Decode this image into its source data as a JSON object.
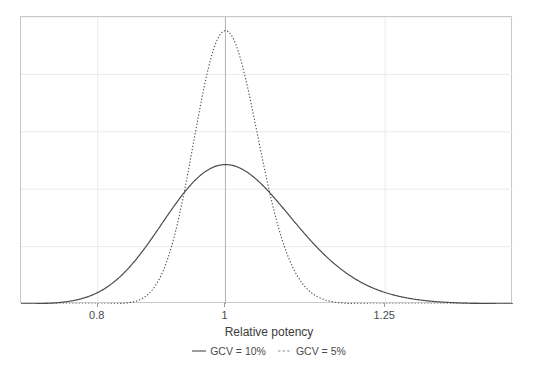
{
  "chart_data": {
    "type": "line",
    "title": "",
    "xlabel": "Relative potency",
    "ylabel": "",
    "xlim": [
      0.68,
      1.45
    ],
    "ylim": [
      0,
      1.05
    ],
    "xticks": [
      0.8,
      1,
      1.25
    ],
    "xticklabels": [
      "0.8",
      "1",
      "1.25"
    ],
    "grid": true,
    "grid_color": "#ebebeb",
    "legend_position": "bottom",
    "reference_line_x": 1,
    "series": [
      {
        "name": "GCV = 10%",
        "style": "solid",
        "color": "#4d4d4d",
        "peak_x": 1,
        "peak_y": 0.51,
        "sigma_log": 0.0998,
        "x": [
          0.68,
          0.7,
          0.72,
          0.74,
          0.76,
          0.78,
          0.8,
          0.82,
          0.84,
          0.86,
          0.88,
          0.9,
          0.92,
          0.94,
          0.96,
          0.98,
          1.0,
          1.02,
          1.04,
          1.06,
          1.08,
          1.1,
          1.13,
          1.16,
          1.19,
          1.22,
          1.25,
          1.28,
          1.32,
          1.36,
          1.4,
          1.45
        ],
        "y": [
          0.033,
          0.048,
          0.068,
          0.093,
          0.123,
          0.158,
          0.197,
          0.239,
          0.281,
          0.323,
          0.362,
          0.398,
          0.429,
          0.454,
          0.473,
          0.485,
          0.49,
          0.488,
          0.481,
          0.468,
          0.451,
          0.43,
          0.393,
          0.352,
          0.31,
          0.268,
          0.229,
          0.194,
          0.153,
          0.119,
          0.092,
          0.064
        ]
      },
      {
        "name": "GCV = 5%",
        "style": "dotted",
        "color": "#4d4d4d",
        "peak_x": 1,
        "peak_y": 1.0,
        "sigma_log": 0.04996,
        "x": [
          0.68,
          0.72,
          0.76,
          0.8,
          0.82,
          0.84,
          0.86,
          0.88,
          0.9,
          0.92,
          0.94,
          0.96,
          0.98,
          1.0,
          1.02,
          1.04,
          1.06,
          1.08,
          1.1,
          1.12,
          1.14,
          1.16,
          1.18,
          1.2,
          1.25,
          1.3,
          1.35,
          1.45
        ],
        "y": [
          0.0,
          0.0,
          0.002,
          0.016,
          0.036,
          0.071,
          0.127,
          0.208,
          0.313,
          0.437,
          0.567,
          0.692,
          0.796,
          0.868,
          0.902,
          0.9,
          0.865,
          0.806,
          0.73,
          0.646,
          0.559,
          0.475,
          0.397,
          0.327,
          0.191,
          0.103,
          0.052,
          0.011
        ]
      }
    ]
  },
  "axis": {
    "x_title": "Relative potency",
    "ticks": [
      {
        "label": "0.8",
        "value": 0.8
      },
      {
        "label": "1",
        "value": 1
      },
      {
        "label": "1.25",
        "value": 1.25
      }
    ]
  },
  "legend": {
    "entries": [
      {
        "label": "GCV = 10%",
        "style": "solid"
      },
      {
        "label": "GCV = 5%",
        "style": "dotted"
      }
    ]
  }
}
